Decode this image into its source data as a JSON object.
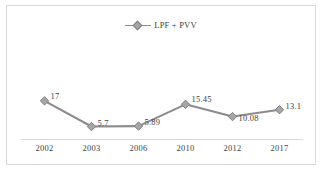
{
  "chart_data": {
    "type": "line",
    "title": "",
    "subtitle": "",
    "xlabel": "",
    "ylabel": "",
    "categories": [
      "2002",
      "2003",
      "2006",
      "2010",
      "2012",
      "2017"
    ],
    "series": [
      {
        "name": "LPF + PVV",
        "values": [
          17,
          5.7,
          5.89,
          15.45,
          10.08,
          13.1
        ],
        "labels": [
          "17",
          "5.7",
          "5.89",
          "15.45",
          "10.08",
          "13.1"
        ],
        "color": "#8c8c8c",
        "marker": "diamond",
        "marker_fill": "#a6a6a6",
        "marker_edge": "#7f7f7f"
      }
    ],
    "ylim": [
      0,
      20
    ],
    "grid": false,
    "y_axis_visible": false,
    "x_axis_line": true,
    "legend": {
      "visible": true,
      "position": "top-center",
      "entries": [
        "LPF + PVV"
      ]
    }
  },
  "frame": {
    "border_color": "#d9d9d9",
    "background": "#ffffff"
  }
}
